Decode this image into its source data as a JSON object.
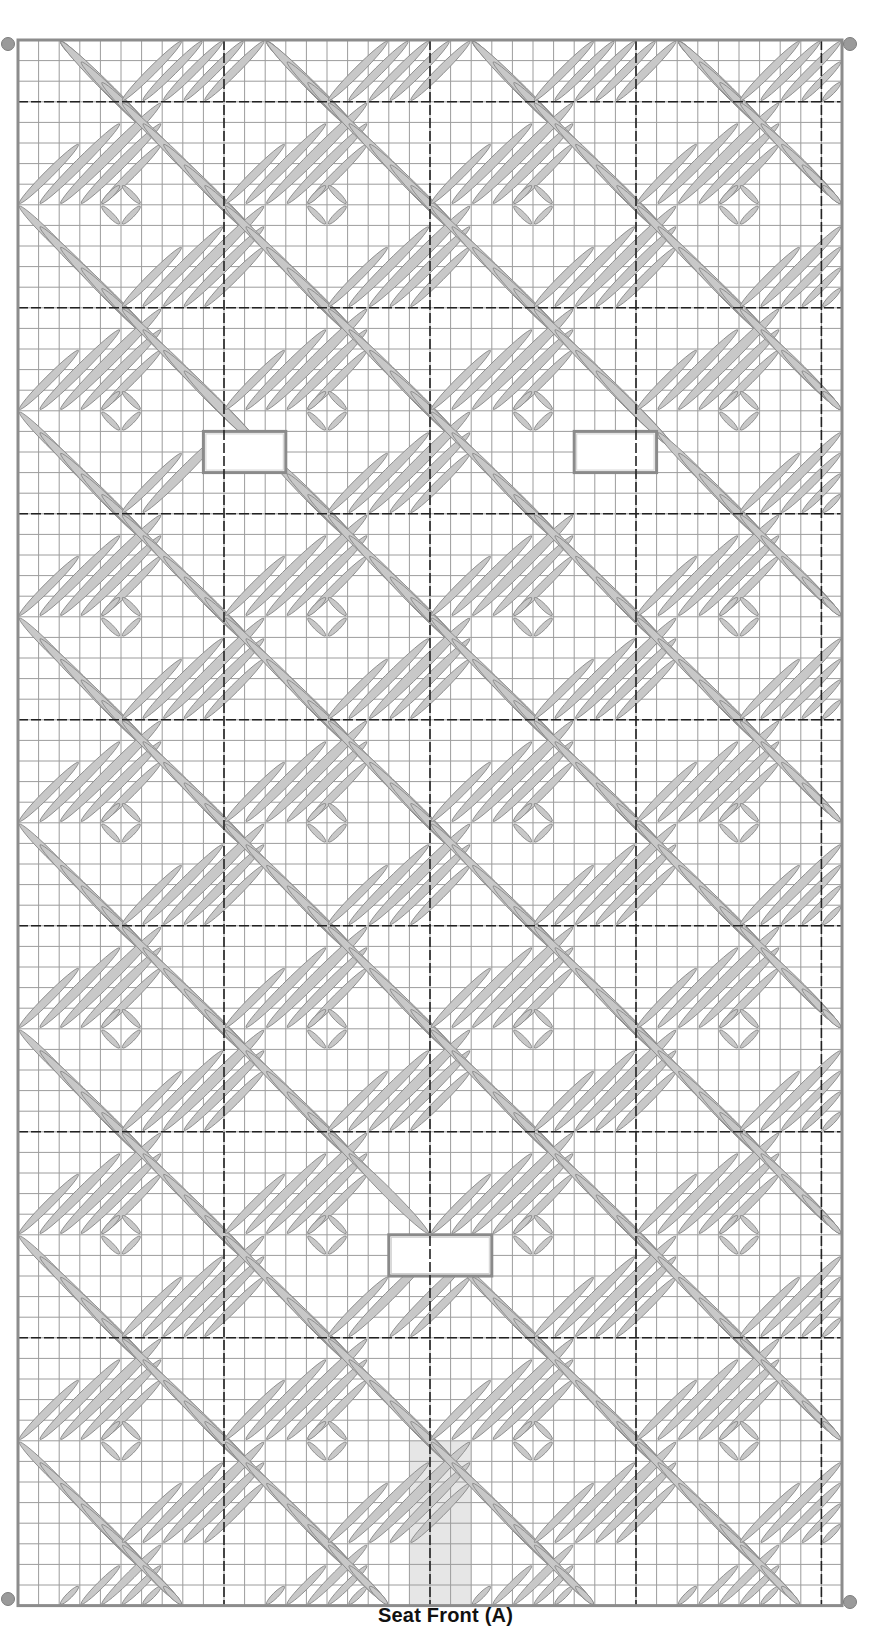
{
  "pattern": {
    "title": "Seat Front (A)",
    "grid": {
      "origin_x": 18,
      "origin_y": 40,
      "cell": 20.6,
      "cols": 40,
      "rows": 76,
      "grid_color": "#9c9c9c",
      "border_color": "#8c8c8c",
      "divider_color": "#222222",
      "divider_every": 10,
      "divider_cols": [
        10,
        20,
        30,
        39
      ],
      "divider_rows": [
        3,
        13,
        23,
        33,
        43,
        53,
        63
      ]
    },
    "stitch": {
      "fill": "#c8c8c8",
      "stroke": "#8a8a8a",
      "motif_size": 10
    },
    "cutouts": [
      {
        "name": "cutout-upper-left",
        "col": 9,
        "row": 19,
        "w": 4,
        "h": 2
      },
      {
        "name": "cutout-upper-right",
        "col": 27,
        "row": 19,
        "w": 4,
        "h": 2
      },
      {
        "name": "cutout-lower-center",
        "col": 18,
        "row": 58,
        "w": 5,
        "h": 2
      }
    ],
    "shaded_region": {
      "col": 19,
      "row": 68,
      "w": 3,
      "h": 8,
      "color": "#e6e6e6"
    },
    "corner_markers": [
      {
        "name": "corner-marker-top-left",
        "x": 1,
        "y": 37
      },
      {
        "name": "corner-marker-top-right",
        "x": 843,
        "y": 37
      },
      {
        "name": "corner-marker-bottom-left",
        "x": 1,
        "y": 1592
      },
      {
        "name": "corner-marker-bottom-right",
        "x": 843,
        "y": 1595
      }
    ]
  }
}
